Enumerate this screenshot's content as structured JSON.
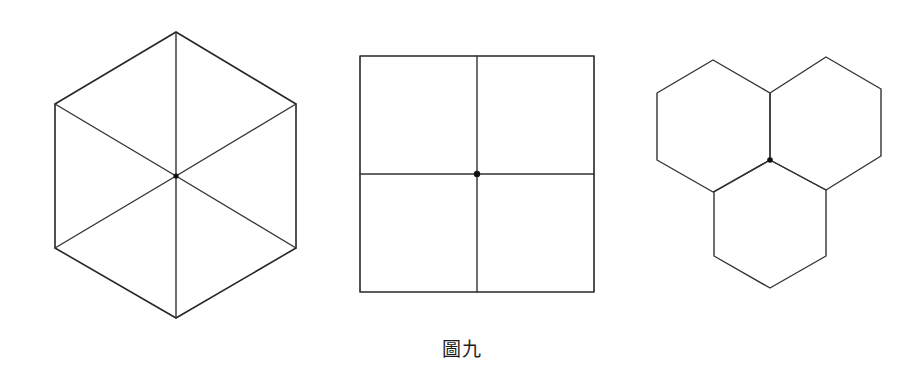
{
  "page": {
    "background_color": "#ffffff",
    "line_color": "#272727",
    "width": 923,
    "height": 389
  },
  "caption": {
    "text": "圖九",
    "language": "zh-Hant",
    "meaning": "Figure Nine"
  },
  "figures": [
    {
      "id": "hexagon-six-triangles",
      "name": "regular hexagon divided into six triangles",
      "center": {
        "x": 176,
        "y": 176
      },
      "center_dot": true,
      "orientation": "pointy-top",
      "vertices": [
        {
          "x": 176,
          "y": 32
        },
        {
          "x": 296,
          "y": 104
        },
        {
          "x": 296,
          "y": 248
        },
        {
          "x": 176,
          "y": 318
        },
        {
          "x": 55,
          "y": 248
        },
        {
          "x": 55,
          "y": 104
        }
      ],
      "internal_divisions": 6,
      "internal_shape": "triangle"
    },
    {
      "id": "square-four-quadrants",
      "name": "square divided into four smaller squares",
      "center": {
        "x": 477,
        "y": 174
      },
      "center_dot": true,
      "bounds": {
        "left": 360,
        "top": 56,
        "right": 594,
        "bottom": 292
      },
      "internal_divisions": 4,
      "internal_shape": "square"
    },
    {
      "id": "three-hexagon-cluster",
      "name": "three regular hexagons meeting at a common vertex",
      "center": {
        "x": 770,
        "y": 160
      },
      "center_dot": true,
      "orientation": "pointy-top",
      "hexagons": [
        {
          "label": "upper-left",
          "vertices": [
            {
              "x": 713,
              "y": 60
            },
            {
              "x": 770,
              "y": 93
            },
            {
              "x": 770,
              "y": 160
            },
            {
              "x": 713,
              "y": 192
            },
            {
              "x": 657,
              "y": 160
            },
            {
              "x": 657,
              "y": 93
            }
          ]
        },
        {
          "label": "upper-right",
          "vertices": [
            {
              "x": 826,
              "y": 57
            },
            {
              "x": 881,
              "y": 89
            },
            {
              "x": 881,
              "y": 156
            },
            {
              "x": 826,
              "y": 190
            },
            {
              "x": 770,
              "y": 160
            },
            {
              "x": 770,
              "y": 93
            }
          ]
        },
        {
          "label": "bottom",
          "vertices": [
            {
              "x": 770,
              "y": 160
            },
            {
              "x": 826,
              "y": 190
            },
            {
              "x": 826,
              "y": 256
            },
            {
              "x": 770,
              "y": 288
            },
            {
              "x": 714,
              "y": 256
            },
            {
              "x": 714,
              "y": 192
            }
          ]
        }
      ]
    }
  ]
}
